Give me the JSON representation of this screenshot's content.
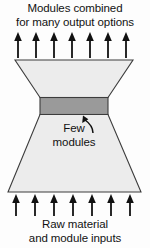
{
  "figure": {
    "name": "hourglass-modularity-diagram",
    "top_caption": {
      "line1": "Modules combined",
      "line2": "for many output options"
    },
    "bottom_caption": {
      "line1": "Raw material",
      "line2": "and module inputs"
    },
    "middle_label": {
      "line1": "Few",
      "line2": "modules"
    },
    "arrows": {
      "top": {
        "count": 7,
        "direction": "up",
        "icon": "arrow-up-icon"
      },
      "bottom": {
        "count": 7,
        "direction": "up",
        "icon": "arrow-up-icon"
      },
      "pointer": {
        "icon": "curved-arrow-up-icon",
        "direction": "up-left",
        "target": "few-modules-band"
      }
    },
    "shapes": {
      "upper_trapezoid": {
        "name": "output-options-trapezoid",
        "orientation": "narrowing-downward"
      },
      "lower_trapezoid": {
        "name": "raw-material-trapezoid",
        "orientation": "widening-downward"
      },
      "middle_band": {
        "name": "few-modules-band",
        "orientation": "horizontal"
      }
    },
    "colors": {
      "background": "#fdfdfd",
      "trapezoid_fill": "#ececec",
      "band_fill": "#9a9a9a",
      "outline": "#3c3c3c",
      "arrow": "#111111",
      "text": "#121212"
    }
  }
}
